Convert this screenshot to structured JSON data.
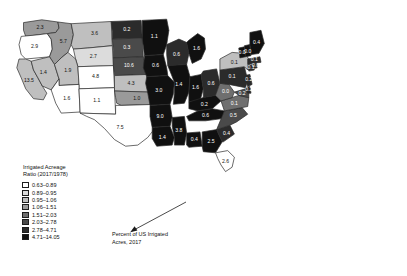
{
  "map": {
    "title": "",
    "projection": "US states choropleth",
    "background": "#ffffff",
    "border_color": "#2b2b2b"
  },
  "legend": {
    "title_line1": "Irrigated Acreage",
    "title_line2": "Ratio (2017/1978)",
    "classes": [
      {
        "label": "0.63–0.89",
        "color": "#ffffff"
      },
      {
        "label": "0.89–0.95",
        "color": "#dcdcdc"
      },
      {
        "label": "0.95–1.06",
        "color": "#bfbfbf"
      },
      {
        "label": "1.06–1.51",
        "color": "#9a9a9a"
      },
      {
        "label": "1.51–2.03",
        "color": "#6f6f6f"
      },
      {
        "label": "2.03–2.78",
        "color": "#4a4a4a"
      },
      {
        "label": "2.78–4.71",
        "color": "#2b2b2b"
      },
      {
        "label": "4.71–14.05",
        "color": "#101010"
      }
    ]
  },
  "annotation": {
    "line1": "Percent of US Irrigated",
    "line2": "Acres, 2017",
    "arrow": "arrow pointing up-left to Texas label"
  },
  "chart_data": {
    "type": "heatmap",
    "value_label": "Percent of US Irrigated Acres, 2017",
    "class_label": "Irrigated Acreage Ratio (2017/1978)",
    "class_bins": [
      "0.63–0.89",
      "0.89–0.95",
      "0.95–1.06",
      "1.06–1.51",
      "1.51–2.03",
      "2.03–2.78",
      "2.78–4.71",
      "4.71–14.05"
    ],
    "class_colors": [
      "#ffffff",
      "#dcdcdc",
      "#bfbfbf",
      "#9a9a9a",
      "#6f6f6f",
      "#4a4a4a",
      "#2b2b2b",
      "#101010"
    ],
    "states": [
      {
        "code": "WA",
        "name": "Washington",
        "value": "2.3",
        "class": 3
      },
      {
        "code": "OR",
        "name": "Oregon",
        "value": "2.9",
        "class": 0
      },
      {
        "code": "ID",
        "name": "Idaho",
        "value": "5.7",
        "class": 3
      },
      {
        "code": "MT",
        "name": "Montana",
        "value": "3.6",
        "class": 2
      },
      {
        "code": "WY",
        "name": "Wyoming",
        "value": "2.7",
        "class": 1
      },
      {
        "code": "CA",
        "name": "California",
        "value": "13.5",
        "class": 2
      },
      {
        "code": "NV",
        "name": "Nevada",
        "value": "1.4",
        "class": 2
      },
      {
        "code": "UT",
        "name": "Utah",
        "value": "1.9",
        "class": 2
      },
      {
        "code": "CO",
        "name": "Colorado",
        "value": "4.8",
        "class": 0
      },
      {
        "code": "AZ",
        "name": "Arizona",
        "value": "1.6",
        "class": 0
      },
      {
        "code": "NM",
        "name": "New Mexico",
        "value": "1.1",
        "class": 0
      },
      {
        "code": "ND",
        "name": "North Dakota",
        "value": "0.2",
        "class": 6
      },
      {
        "code": "SD",
        "name": "South Dakota",
        "value": "0.3",
        "class": 5
      },
      {
        "code": "NE",
        "name": "Nebraska",
        "value": "10.6",
        "class": 5
      },
      {
        "code": "KS",
        "name": "Kansas",
        "value": "4.3",
        "class": 2
      },
      {
        "code": "OK",
        "name": "Oklahoma",
        "value": "1.0",
        "class": 3
      },
      {
        "code": "TX",
        "name": "Texas",
        "value": "7.5",
        "class": 0
      },
      {
        "code": "MN",
        "name": "Minnesota",
        "value": "1.1",
        "class": 7
      },
      {
        "code": "IA",
        "name": "Iowa",
        "value": "0.6",
        "class": 7
      },
      {
        "code": "MO",
        "name": "Missouri",
        "value": "3.0",
        "class": 7
      },
      {
        "code": "AR",
        "name": "Arkansas",
        "value": "9.0",
        "class": 7
      },
      {
        "code": "LA",
        "name": "Louisiana",
        "value": "1.4",
        "class": 7
      },
      {
        "code": "MS",
        "name": "Mississippi",
        "value": "3.8",
        "class": 7
      },
      {
        "code": "WI",
        "name": "Wisconsin",
        "value": "0.6",
        "class": 6
      },
      {
        "code": "MI",
        "name": "Michigan",
        "value": "1.6",
        "class": 7
      },
      {
        "code": "IL",
        "name": "Illinois",
        "value": "1.4",
        "class": 7
      },
      {
        "code": "IN",
        "name": "Indiana",
        "value": "1.6",
        "class": 7
      },
      {
        "code": "OH",
        "name": "Ohio",
        "value": "0.6",
        "class": 6
      },
      {
        "code": "KY",
        "name": "Kentucky",
        "value": "0.2",
        "class": 7
      },
      {
        "code": "TN",
        "name": "Tennessee",
        "value": "0.6",
        "class": 7
      },
      {
        "code": "AL",
        "name": "Alabama",
        "value": "0.4",
        "class": 7
      },
      {
        "code": "GA",
        "name": "Georgia",
        "value": "2.5",
        "class": 7
      },
      {
        "code": "FL",
        "name": "Florida",
        "value": "2.6",
        "class": 0
      },
      {
        "code": "SC",
        "name": "South Carolina",
        "value": "0.4",
        "class": 6
      },
      {
        "code": "NC",
        "name": "North Carolina",
        "value": "0.5",
        "class": 5
      },
      {
        "code": "VA",
        "name": "Virginia",
        "value": "0.1",
        "class": 4
      },
      {
        "code": "WV",
        "name": "West Virginia",
        "value": "0.0",
        "class": 4
      },
      {
        "code": "MD",
        "name": "Maryland",
        "value": "0.2",
        "class": 5
      },
      {
        "code": "DE",
        "name": "Delaware",
        "value": "0.2",
        "class": 6
      },
      {
        "code": "PA",
        "name": "Pennsylvania",
        "value": "0.1",
        "class": 6
      },
      {
        "code": "NJ",
        "name": "New Jersey",
        "value": "0.2",
        "class": 6
      },
      {
        "code": "NY",
        "name": "New York",
        "value": "0.1",
        "class": 2
      },
      {
        "code": "CT",
        "name": "Connecticut",
        "value": "0.1",
        "class": 6
      },
      {
        "code": "RI",
        "name": "Rhode Island",
        "value": "0.0",
        "class": 6
      },
      {
        "code": "MA",
        "name": "Massachusetts",
        "value": "0.1",
        "class": 6
      },
      {
        "code": "VT",
        "name": "Vermont",
        "value": "0.0",
        "class": 7
      },
      {
        "code": "NH",
        "name": "New Hampshire",
        "value": "0.0",
        "class": 7
      },
      {
        "code": "ME",
        "name": "Maine",
        "value": "0.4",
        "class": 7
      }
    ]
  }
}
